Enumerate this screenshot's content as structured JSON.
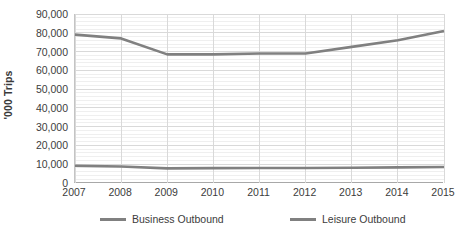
{
  "chart_data": {
    "type": "line",
    "title": "",
    "xlabel": "",
    "ylabel": "'000 Trips",
    "x": [
      2007,
      2008,
      2009,
      2010,
      2011,
      2012,
      2013,
      2014,
      2015
    ],
    "categories": [
      "2007",
      "2008",
      "2009",
      "2010",
      "2011",
      "2012",
      "2013",
      "2014",
      "2015"
    ],
    "series": [
      {
        "name": "Business Outbound",
        "color": "#808080",
        "values": [
          9200,
          8800,
          7800,
          7900,
          8000,
          8000,
          8100,
          8300,
          8500
        ]
      },
      {
        "name": "Leisure Outbound",
        "color": "#808080",
        "values": [
          79000,
          77000,
          68500,
          68500,
          69000,
          69000,
          72500,
          76000,
          81000
        ]
      }
    ],
    "ylim": [
      0,
      90000
    ],
    "y_ticks": [
      0,
      10000,
      20000,
      30000,
      40000,
      50000,
      60000,
      70000,
      80000,
      90000
    ],
    "y_tick_labels": [
      "0",
      "10,000",
      "20,000",
      "30,000",
      "40,000",
      "50,000",
      "60,000",
      "70,000",
      "80,000",
      "90,000"
    ],
    "grid": true,
    "minor_grid": true,
    "legend_position": "bottom",
    "grid_color": "#d9d9d9",
    "minor_grid_color": "#efefef",
    "axis_color": "#a8a8a8"
  },
  "legend": {
    "entries": [
      {
        "label": "Business Outbound",
        "color": "#808080"
      },
      {
        "label": "Leisure Outbound",
        "color": "#808080"
      }
    ]
  }
}
